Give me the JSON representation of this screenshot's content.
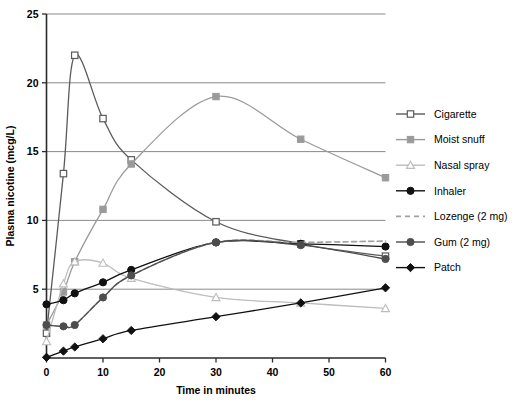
{
  "chart_data": {
    "type": "line",
    "title": "",
    "xlabel": "Time in minutes",
    "ylabel": "Plasma nicotine (mcg/L)",
    "xlim": [
      0,
      60
    ],
    "ylim": [
      0,
      25
    ],
    "xticks": [
      0,
      10,
      20,
      30,
      40,
      50,
      60
    ],
    "yticks": [
      0,
      5,
      10,
      15,
      20,
      25
    ],
    "xtick_labels": [
      "0",
      "10",
      "20",
      "30",
      "40",
      "50",
      "60"
    ],
    "ytick_labels": [
      "0",
      "5",
      "10",
      "15",
      "20",
      "25"
    ],
    "grid": "horizontal",
    "legend_position": "right",
    "series": [
      {
        "name": "Cigarette",
        "color": "#5a5a5a",
        "marker": "square-open",
        "dash": "solid",
        "x": [
          0,
          3,
          5,
          10,
          15,
          30,
          45,
          60
        ],
        "y": [
          1.8,
          13.4,
          22.0,
          17.4,
          14.4,
          9.9,
          8.3,
          7.4
        ]
      },
      {
        "name": "Moist snuff",
        "color": "#9a9a9a",
        "marker": "square-filled",
        "dash": "solid",
        "x": [
          0,
          3,
          5,
          10,
          15,
          30,
          45,
          60
        ],
        "y": [
          2.4,
          4.8,
          7.0,
          10.8,
          14.1,
          19.0,
          15.9,
          13.1
        ]
      },
      {
        "name": "Nasal spray",
        "color": "#bdbdbd",
        "marker": "triangle-open",
        "dash": "solid",
        "x": [
          0,
          3,
          5,
          10,
          15,
          30,
          45,
          60
        ],
        "y": [
          1.2,
          5.4,
          7.0,
          6.9,
          5.8,
          4.4,
          4.0,
          3.6
        ]
      },
      {
        "name": "Inhaler",
        "color": "#111111",
        "marker": "circle-filled",
        "dash": "solid",
        "x": [
          0,
          3,
          5,
          10,
          15,
          30,
          45,
          60
        ],
        "y": [
          3.9,
          4.2,
          4.7,
          5.5,
          6.4,
          8.4,
          8.3,
          8.1
        ]
      },
      {
        "name": "Lozenge (2 mg)",
        "color": "#a0a0a0",
        "marker": "none",
        "dash": "dashed",
        "x": [
          0,
          3,
          5,
          10,
          15,
          30,
          45,
          60
        ],
        "y": [
          2.4,
          2.3,
          2.4,
          4.4,
          6.0,
          8.4,
          8.4,
          8.5
        ]
      },
      {
        "name": "Gum (2 mg)",
        "color": "#4d4d4d",
        "marker": "circle-filled",
        "dash": "solid",
        "x": [
          0,
          3,
          5,
          10,
          15,
          30,
          45,
          60
        ],
        "y": [
          2.4,
          2.3,
          2.4,
          4.4,
          6.0,
          8.4,
          8.2,
          7.2
        ]
      },
      {
        "name": "Patch",
        "color": "#111111",
        "marker": "diamond-filled",
        "dash": "solid",
        "x": [
          0,
          3,
          5,
          10,
          15,
          30,
          45,
          60
        ],
        "y": [
          0.05,
          0.5,
          0.8,
          1.4,
          2.0,
          3.0,
          4.0,
          5.1
        ]
      }
    ]
  },
  "legend": {
    "items": [
      {
        "label": "Cigarette"
      },
      {
        "label": "Moist snuff"
      },
      {
        "label": "Nasal spray"
      },
      {
        "label": "Inhaler"
      },
      {
        "label": "Lozenge (2 mg)"
      },
      {
        "label": "Gum (2 mg)"
      },
      {
        "label": "Patch"
      }
    ]
  },
  "colors": {
    "background": "#ffffff",
    "axis": "#2b2b2b",
    "grid": "#7d7d7d",
    "text": "#000000"
  }
}
